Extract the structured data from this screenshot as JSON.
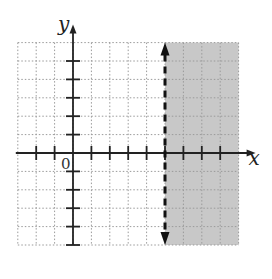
{
  "chart_data": {
    "type": "region",
    "title": "",
    "xlabel": "x",
    "ylabel": "y",
    "origin_label": "0",
    "xlim": [
      -3,
      9
    ],
    "ylim": [
      -5,
      6
    ],
    "grid": true,
    "grid_style": "dotted",
    "unit_px": 18.4,
    "origin_px": [
      73,
      153
    ],
    "x_ticks": [
      -2,
      -1,
      1,
      2,
      3,
      4,
      5,
      6,
      7,
      8
    ],
    "y_ticks": [
      -5,
      -4,
      -3,
      -2,
      -1,
      1,
      2,
      3,
      4,
      5
    ],
    "boundary": {
      "equation": "x = 5",
      "style": "dashed",
      "arrows": "both"
    },
    "inequality": "x > 5",
    "shaded_region": {
      "x_from": 5,
      "x_to": 9
    },
    "colors": {
      "shade": "#c8c8c8",
      "axis": "#222222",
      "grid": "#9a9a9a",
      "boundary": "#111111"
    }
  }
}
